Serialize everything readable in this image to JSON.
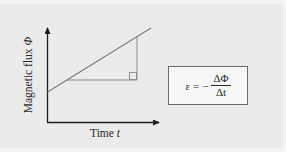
{
  "diagram": {
    "y_axis": {
      "label": "Magnetic flux",
      "symbol": "Φ"
    },
    "x_axis": {
      "label": "Time",
      "symbol": "t"
    },
    "formula": {
      "lhs": "ε",
      "equals": "=",
      "sign": "−",
      "numerator": "ΔΦ",
      "denominator": "Δt"
    },
    "colors": {
      "axis": "#1e1e1e",
      "flux_line": "#7a7a7a",
      "triangle": "#8a8a8a",
      "background": "#ebebeb"
    }
  }
}
